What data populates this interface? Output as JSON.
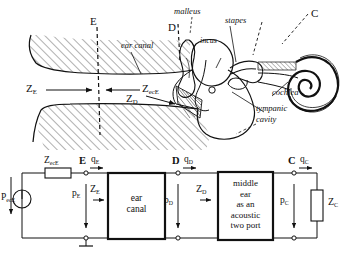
{
  "figure": {
    "ink_color": "#111111",
    "background": "#ffffff"
  },
  "anatomy": {
    "name": "outer-and-middle-ear-cross-section",
    "labels": {
      "plane_E": "E",
      "plane_D": "D",
      "plane_C": "C",
      "ear_canal": "ear canal",
      "malleus": "malleus",
      "incus": "incus",
      "stapes": "stapes",
      "cochlea": "cochlea",
      "tympanic_cavity_line1": "tympanic",
      "tympanic_cavity_line2": "cavity",
      "impedance_E": "Z",
      "impedance_E_sub": "E",
      "impedance_ecE": "Z",
      "impedance_ecE_sub": "ecE",
      "impedance_D": "Z",
      "impedance_D_sub": "D"
    }
  },
  "circuit": {
    "name": "acoustic-two-port-equivalent-circuit",
    "source": {
      "symbol": "circle-with-vertical-line",
      "label_main": "P",
      "label_sub": "ecE"
    },
    "series_impedance": {
      "label_main": "Z",
      "label_sub": "ecE"
    },
    "nodes": [
      {
        "name": "node-E",
        "label": "E"
      },
      {
        "name": "node-D",
        "label": "D"
      },
      {
        "name": "node-C",
        "label": "C"
      }
    ],
    "flows": [
      {
        "name": "flow-qE",
        "main": "q",
        "sub": "E"
      },
      {
        "name": "flow-qD",
        "main": "q",
        "sub": "D"
      },
      {
        "name": "flow-qC",
        "main": "q",
        "sub": "C"
      }
    ],
    "pressures": [
      {
        "name": "pressure-pE",
        "main": "p",
        "sub": "E"
      },
      {
        "name": "pressure-pD",
        "main": "p",
        "sub": "D"
      },
      {
        "name": "pressure-pC",
        "main": "p",
        "sub": "C"
      }
    ],
    "impedances": [
      {
        "name": "impedance-ZE",
        "main": "Z",
        "sub": "E"
      },
      {
        "name": "impedance-ZD",
        "main": "Z",
        "sub": "D"
      },
      {
        "name": "impedance-ZC",
        "main": "Z",
        "sub": "C"
      }
    ],
    "blocks": [
      {
        "name": "block-ear-canal",
        "lines": [
          "ear",
          "canal"
        ]
      },
      {
        "name": "block-middle-ear-two-port",
        "lines": [
          "middle",
          "ear",
          "as an",
          "acoustic",
          "two port"
        ]
      }
    ],
    "ground": {
      "name": "ground-symbol",
      "label": ""
    }
  }
}
